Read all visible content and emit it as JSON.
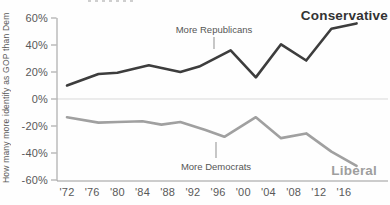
{
  "chart_data": {
    "type": "line",
    "title": "",
    "ylabel": "How many more identify as GOP than Dem",
    "xlabel": "",
    "ylim": [
      -60,
      60
    ],
    "grid": "zero-baseline-only",
    "legend_position": "labels-at-line-ends",
    "unit": "%",
    "y_ticks": [
      {
        "label": "60%",
        "value": 60
      },
      {
        "label": "40%",
        "value": 40
      },
      {
        "label": "20%",
        "value": 20
      },
      {
        "label": "0%",
        "value": 0
      },
      {
        "label": "-20%",
        "value": -20
      },
      {
        "label": "-40%",
        "value": -40
      },
      {
        "label": "-60%",
        "value": -60
      }
    ],
    "x_ticks": [
      {
        "label": "'72",
        "year": 1972
      },
      {
        "label": "'76",
        "year": 1976
      },
      {
        "label": "'80",
        "year": 1980
      },
      {
        "label": "'84",
        "year": 1984
      },
      {
        "label": "'88",
        "year": 1988
      },
      {
        "label": "'92",
        "year": 1992
      },
      {
        "label": "'96",
        "year": 1996
      },
      {
        "label": "'00",
        "year": 2000
      },
      {
        "label": "'04",
        "year": 2004
      },
      {
        "label": "'08",
        "year": 2008
      },
      {
        "label": "'12",
        "year": 2012
      },
      {
        "label": "'16",
        "year": 2016
      }
    ],
    "series": [
      {
        "name": "Conservative",
        "color": "#3d3d3d",
        "x": [
          1972,
          1977,
          1980,
          1985,
          1990,
          1993,
          1998,
          2002,
          2006,
          2010,
          2014,
          2018
        ],
        "values": [
          10,
          18.5,
          19.5,
          25,
          20,
          24,
          36,
          16,
          40.5,
          28.5,
          52,
          56
        ]
      },
      {
        "name": "Liberal",
        "color": "#a0a0a0",
        "x": [
          1972,
          1977,
          1980,
          1984,
          1987,
          1990,
          1994,
          1997,
          2002,
          2006,
          2010,
          2014,
          2018
        ],
        "values": [
          -13.5,
          -17.5,
          -17,
          -16.5,
          -19,
          -17,
          -23,
          -28,
          -13.5,
          -29,
          -25.5,
          -39,
          -49.5
        ]
      }
    ],
    "annotations": [
      {
        "text": "More Republicans",
        "pointer": "down",
        "near_year": 1995,
        "side": "positive"
      },
      {
        "text": "More Democrats",
        "pointer": "up",
        "near_year": 1995,
        "side": "negative"
      }
    ]
  }
}
